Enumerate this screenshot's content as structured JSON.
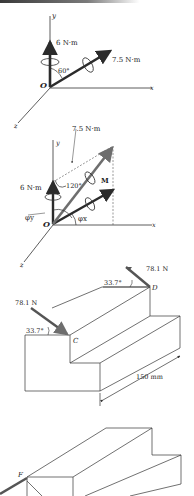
{
  "figure1": {
    "axis_y": "y",
    "axis_x": "x",
    "axis_z": "z",
    "origin": "O",
    "moment_vertical": "6 N·m",
    "moment_inclined": "7.5 N·m",
    "angle": "60°"
  },
  "figure2": {
    "axis_y": "y",
    "axis_x": "x",
    "axis_z": "z",
    "origin": "O",
    "moment_vertical": "6 N·m",
    "moment_inclined": "7.5 N·m",
    "angle": "120°",
    "resultant": "M",
    "phi_y": "φy",
    "phi_x": "φx"
  },
  "figure3": {
    "force_c": "78.1 N",
    "force_d": "78.1 N",
    "angle_c": "33.7°",
    "angle_d": "33.7°",
    "point_c": "C",
    "point_d": "D",
    "dimension": "150 mm"
  },
  "figure4": {
    "point_f": "F"
  },
  "colors": {
    "arrow_dark": "#2b2b2b",
    "arrow_gray": "#6e6e6e",
    "line": "#333333"
  }
}
